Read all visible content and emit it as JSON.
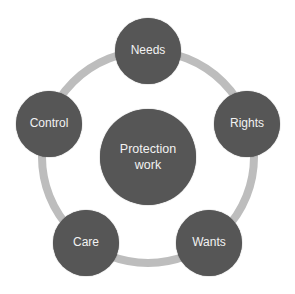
{
  "diagram": {
    "type": "cycle",
    "center": {
      "label_line1": "Protection",
      "label_line2": "work"
    },
    "nodes": [
      {
        "label": "Needs"
      },
      {
        "label": "Rights"
      },
      {
        "label": "Wants"
      },
      {
        "label": "Care"
      },
      {
        "label": "Control"
      }
    ],
    "colors": {
      "node_fill": "#565656",
      "ring": "#bdbdbd",
      "text": "#f2f2f2"
    }
  }
}
